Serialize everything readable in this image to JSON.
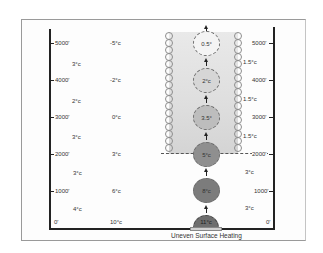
{
  "diagram": {
    "caption": "Uneven Surface Heating",
    "left_axis": {
      "altitudes": [
        "5000'",
        "4000'",
        "3000'",
        "2000'",
        "1000'",
        "0'"
      ],
      "lapse_labels": [
        "3°c",
        "2°c",
        "3°c",
        "3°c",
        "4°c"
      ],
      "environment_temps": [
        "-5°c",
        "-2°c",
        "0°c",
        "3°c",
        "6°c",
        "10°c"
      ]
    },
    "right_axis": {
      "altitudes": [
        "5000'",
        "4000'",
        "3000'",
        "2000'",
        "1000'",
        "0'"
      ],
      "lapse_labels": [
        "1.5°c",
        "1.5°c",
        "1.5°c",
        "3°c",
        "3°c"
      ]
    },
    "parcels": [
      {
        "label": "0.5°",
        "color": "#f4f4f4"
      },
      {
        "label": "2°c",
        "color": "#d6d6d6"
      },
      {
        "label": "3.5°",
        "color": "#bdbdbd"
      },
      {
        "label": "5°c",
        "color": "#8f8f8f"
      },
      {
        "label": "8°c",
        "color": "#7c7c7c"
      },
      {
        "label": "11°c",
        "color": "#6e6e6e"
      }
    ],
    "condensation_level": "2000'"
  }
}
